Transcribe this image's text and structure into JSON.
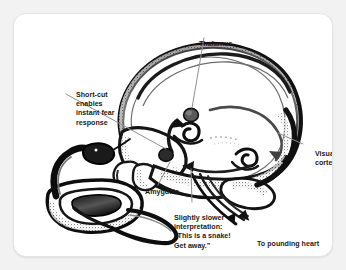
{
  "figure": {
    "kind": "brain-fear-pathway-diagram",
    "background_color": "#f2f2f2",
    "card_color": "#ffffff",
    "ink_color": "#1a1a1a",
    "leader_line_color": "#8a8a8a"
  },
  "labels": {
    "thalamus": "Thalamus",
    "short_cut": "Short-cut\nenables\ninstant fear\nresponse",
    "visual_cortex": "Visual\ncortex",
    "amygdala": "Amygdala",
    "slower_interpretation": "Slightly slower\ninterpretation:\n“This is a snake!\nGet away.”",
    "pounding_heart": "To pounding heart"
  },
  "illustrations": {
    "brain": "brain-cross-section-ink-drawing",
    "snake": "coiled-snake-ink-drawing"
  }
}
